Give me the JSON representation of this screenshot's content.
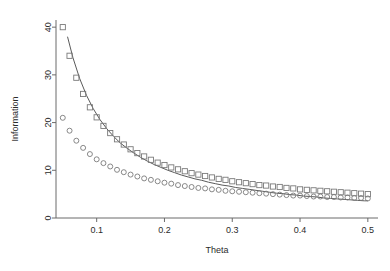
{
  "chart_data": {
    "type": "scatter",
    "title": "",
    "xlabel": "Theta",
    "ylabel": "Information",
    "xlim": [
      0.04,
      0.515
    ],
    "ylim": [
      0,
      41.5
    ],
    "grid": false,
    "legend": null,
    "xticks": [
      0.1,
      0.2,
      0.3,
      0.4,
      0.5
    ],
    "xtick_labels": [
      "0.1",
      "0.2",
      "0.3",
      "0.4",
      "0.5"
    ],
    "yticks": [
      0,
      10,
      20,
      30,
      40
    ],
    "ytick_labels": [
      "0",
      "10",
      "20",
      "30",
      "40"
    ],
    "series": [
      {
        "name": "squares",
        "marker": "open-square",
        "color": "#7a7a7a",
        "x": [
          0.05,
          0.06,
          0.07,
          0.08,
          0.09,
          0.1,
          0.11,
          0.12,
          0.13,
          0.14,
          0.15,
          0.16,
          0.17,
          0.18,
          0.19,
          0.2,
          0.21,
          0.22,
          0.23,
          0.24,
          0.25,
          0.26,
          0.27,
          0.28,
          0.29,
          0.3,
          0.31,
          0.32,
          0.33,
          0.34,
          0.35,
          0.36,
          0.37,
          0.38,
          0.39,
          0.4,
          0.41,
          0.42,
          0.43,
          0.44,
          0.45,
          0.46,
          0.47,
          0.48,
          0.49,
          0.5
        ],
        "y": [
          40.0,
          34.0,
          29.4,
          26.0,
          23.2,
          21.1,
          19.3,
          17.8,
          16.5,
          15.4,
          14.4,
          13.6,
          12.9,
          12.2,
          11.6,
          11.1,
          10.6,
          10.2,
          9.8,
          9.4,
          9.1,
          8.8,
          8.5,
          8.2,
          8.0,
          7.7,
          7.5,
          7.3,
          7.1,
          6.9,
          6.8,
          6.6,
          6.5,
          6.3,
          6.2,
          6.0,
          5.9,
          5.8,
          5.7,
          5.6,
          5.5,
          5.4,
          5.3,
          5.2,
          5.1,
          5.0
        ]
      },
      {
        "name": "circles",
        "marker": "open-circle",
        "color": "#7a7a7a",
        "x": [
          0.05,
          0.06,
          0.07,
          0.08,
          0.09,
          0.1,
          0.11,
          0.12,
          0.13,
          0.14,
          0.15,
          0.16,
          0.17,
          0.18,
          0.19,
          0.2,
          0.21,
          0.22,
          0.23,
          0.24,
          0.25,
          0.26,
          0.27,
          0.28,
          0.29,
          0.3,
          0.31,
          0.32,
          0.33,
          0.34,
          0.35,
          0.36,
          0.37,
          0.38,
          0.39,
          0.4,
          0.41,
          0.42,
          0.43,
          0.44,
          0.45,
          0.46,
          0.47,
          0.48,
          0.49,
          0.5
        ],
        "y": [
          21.0,
          18.3,
          16.2,
          14.7,
          13.4,
          12.3,
          11.5,
          10.8,
          10.1,
          9.6,
          9.1,
          8.7,
          8.3,
          8.0,
          7.7,
          7.4,
          7.2,
          6.9,
          6.7,
          6.5,
          6.3,
          6.2,
          6.0,
          5.9,
          5.7,
          5.6,
          5.5,
          5.4,
          5.3,
          5.2,
          5.1,
          5.0,
          4.9,
          4.8,
          4.7,
          4.7,
          4.6,
          4.5,
          4.5,
          4.4,
          4.4,
          4.3,
          4.3,
          4.2,
          4.2,
          4.1
        ]
      },
      {
        "name": "curve",
        "marker": "line",
        "color": "#5a5a5a",
        "x": [
          0.057,
          0.065,
          0.075,
          0.085,
          0.095,
          0.105,
          0.115,
          0.125,
          0.135,
          0.145,
          0.155,
          0.165,
          0.175,
          0.185,
          0.195,
          0.205,
          0.215,
          0.225,
          0.235,
          0.245,
          0.255,
          0.265,
          0.275,
          0.285,
          0.295,
          0.305,
          0.315,
          0.325,
          0.335,
          0.345,
          0.355,
          0.365,
          0.375,
          0.385,
          0.395,
          0.405,
          0.415,
          0.425,
          0.435,
          0.445,
          0.455,
          0.465,
          0.475,
          0.485,
          0.495,
          0.5
        ],
        "y": [
          38.0,
          33.6,
          29.2,
          25.7,
          22.9,
          20.6,
          18.7,
          17.1,
          15.7,
          14.6,
          13.6,
          12.7,
          11.9,
          11.2,
          10.6,
          10.0,
          9.5,
          9.0,
          8.6,
          8.2,
          7.9,
          7.5,
          7.2,
          6.9,
          6.7,
          6.4,
          6.2,
          6.0,
          5.8,
          5.6,
          5.4,
          5.2,
          5.1,
          4.9,
          4.8,
          4.6,
          4.5,
          4.4,
          4.2,
          4.1,
          4.0,
          3.9,
          3.8,
          3.7,
          3.6,
          3.6
        ]
      }
    ]
  }
}
